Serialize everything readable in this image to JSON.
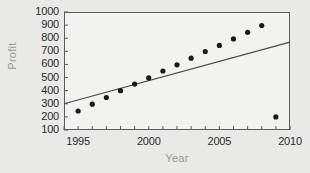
{
  "chart_data": {
    "type": "scatter",
    "title": "",
    "xlabel": "Year",
    "ylabel": "Profit",
    "xlim": [
      1994,
      2010
    ],
    "ylim": [
      100,
      1000
    ],
    "grid": false,
    "legend": null,
    "x_ticks_major": [
      "1995",
      "2000",
      "2005",
      "2010"
    ],
    "x_ticks_major_values": [
      1995,
      2000,
      2005,
      2010
    ],
    "x_ticks_minor_values": [
      1994,
      1995,
      1996,
      1997,
      1998,
      1999,
      2000,
      2001,
      2002,
      2003,
      2004,
      2005,
      2006,
      2007,
      2008,
      2009,
      2010
    ],
    "y_ticks": [
      "100",
      "200",
      "300",
      "400",
      "500",
      "600",
      "700",
      "800",
      "900",
      "1000"
    ],
    "y_tick_values": [
      100,
      200,
      300,
      400,
      500,
      600,
      700,
      800,
      900,
      1000
    ],
    "x": [
      1995,
      1996,
      1997,
      1998,
      1999,
      2000,
      2001,
      2002,
      2003,
      2004,
      2005,
      2006,
      2007,
      2008,
      2009
    ],
    "values": [
      245,
      297,
      348,
      400,
      450,
      497,
      550,
      597,
      648,
      698,
      745,
      795,
      845,
      897,
      200
    ],
    "point_color": "#1a1a1a",
    "point_radius": 2.6,
    "trendline": {
      "x": [
        1994,
        2010
      ],
      "y": [
        300,
        770
      ],
      "color": "#4a4a4a",
      "width": 1.2
    },
    "colors": {
      "background": "#e9e9e7",
      "plot_background": "#f2f2f0",
      "frame": "#5b5b5b",
      "axis_title": "#9a9a98",
      "tick_label": "#2b2b2b"
    }
  }
}
